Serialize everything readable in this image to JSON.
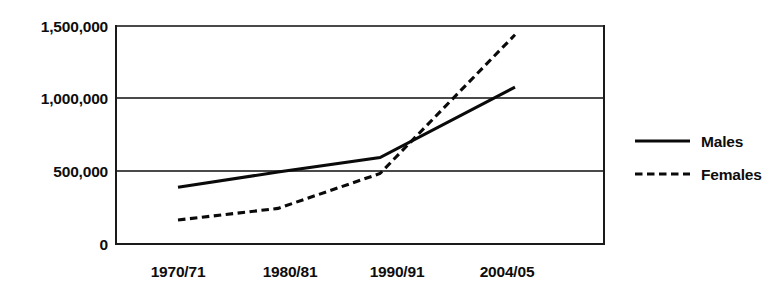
{
  "chart_data": {
    "type": "line",
    "title": "",
    "subtitle": "",
    "xlabel": "",
    "ylabel": "",
    "categories": [
      "1970/71",
      "1980/81",
      "1990/91",
      "2004/05"
    ],
    "series": [
      {
        "name": "Males",
        "style": "solid",
        "values": [
          390000,
          495000,
          595000,
          1080000
        ]
      },
      {
        "name": "Females",
        "style": "dashed",
        "values": [
          165000,
          245000,
          485000,
          1440000
        ]
      }
    ],
    "ylim": [
      0,
      1500000
    ],
    "yticks": [
      0,
      500000,
      1000000,
      1500000
    ],
    "ytick_labels": [
      "0",
      "500,000",
      "1,000,000",
      "1,500,000"
    ],
    "grid": true,
    "legend_position": "right",
    "colors": {
      "line": "#0a0a0a",
      "grid": "#4a4a4a",
      "axis": "#1a1a1a",
      "background": "#ffffff"
    }
  },
  "axes": {
    "y": {
      "ticks": [
        {
          "label": "1,500,000",
          "value": 1500000
        },
        {
          "label": "1,000,000",
          "value": 1000000
        },
        {
          "label": "500,000",
          "value": 500000
        },
        {
          "label": "0",
          "value": 0
        }
      ]
    },
    "x": {
      "ticks": [
        {
          "label": "1970/71"
        },
        {
          "label": "1980/81"
        },
        {
          "label": "1990/91"
        },
        {
          "label": "2004/05"
        }
      ]
    }
  },
  "legend": {
    "entries": [
      {
        "label": "Males",
        "style": "solid"
      },
      {
        "label": "Females",
        "style": "dashed"
      }
    ]
  }
}
